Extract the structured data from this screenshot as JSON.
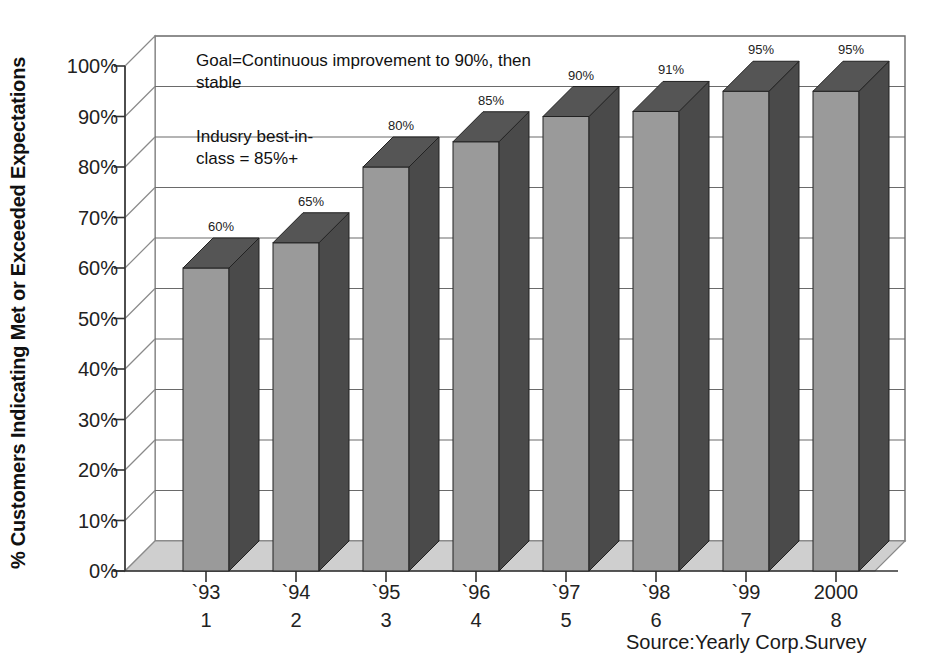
{
  "chart_data": {
    "type": "bar",
    "title": "",
    "xlabel": "",
    "ylabel": "% Customers Indicating Met or Exceeded Expectations",
    "categories": [
      "`93",
      "`94",
      "`95",
      "`96",
      "`97",
      "`98",
      "`99",
      "2000"
    ],
    "category_numbers": [
      "1",
      "2",
      "3",
      "4",
      "5",
      "6",
      "7",
      "8"
    ],
    "values": [
      60,
      65,
      80,
      85,
      90,
      91,
      95,
      95
    ],
    "data_labels": [
      "60%",
      "65%",
      "80%",
      "85%",
      "90%",
      "91%",
      "95%",
      "95%"
    ],
    "ylim": [
      0,
      100
    ],
    "ytick_labels": [
      "100%",
      "90%",
      "80%",
      "70%",
      "60%",
      "50%",
      "40%",
      "30%",
      "20%",
      "10%",
      "0%"
    ],
    "ytick_values": [
      100,
      90,
      80,
      70,
      60,
      50,
      40,
      30,
      20,
      10,
      0
    ],
    "grid": true,
    "legend": "none",
    "style": "3d-column",
    "annotations": [
      "Goal=Continuous improvement to 90%, then stable",
      "Indusry best-in-\nclass = 85%+"
    ],
    "source": "Source:Yearly Corp.Survey",
    "colors": {
      "bar_front": "#9a9a9a",
      "bar_side": "#4a4a4a",
      "bar_top": "#555555",
      "floor": "#cfcfcf",
      "wall": "#ffffff",
      "gridline": "#6a6a6a",
      "axis": "#333333",
      "background": "#ffffff",
      "text": "#1a1a1a"
    }
  },
  "axis": {
    "y_title": "% Customers Indicating Met or Exceeded Expectations"
  },
  "annotations": {
    "goal": "Goal=Continuous improvement to 90%, then\nstable",
    "best_in_class": "Indusry best-in-\nclass = 85%+"
  },
  "source": {
    "text": "Source:Yearly Corp.Survey"
  }
}
